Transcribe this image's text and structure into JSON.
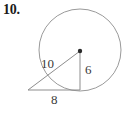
{
  "problem": {
    "number_label": "10."
  },
  "figure": {
    "type": "circle-with-inscribed-right-triangle",
    "labels": {
      "hypotenuse": "10",
      "vertical_leg": "6",
      "base_leg": "8"
    },
    "colors": {
      "background": "#ffffff",
      "circle_stroke": "#9a9a9a",
      "triangle_stroke": "#8d8d8d",
      "center_dot": "#2b2b2b",
      "number_text": "#1a1a1a",
      "label_text": "#3a3a3a"
    },
    "geometry": {
      "circle_center_x": 80,
      "circle_center_y": 50,
      "circle_radius": 41,
      "triangle_left_vertex_x": 28,
      "triangle_left_vertex_y": 90,
      "triangle_right_vertex_x": 80,
      "triangle_right_vertex_y": 90,
      "triangle_apex_x": 80,
      "triangle_apex_y": 51,
      "center_dot_radius": 2.2
    }
  }
}
